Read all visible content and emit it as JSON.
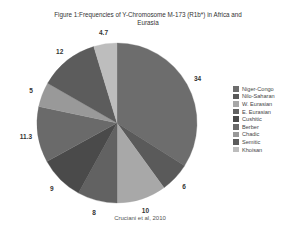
{
  "chart_data": {
    "type": "pie",
    "title": "Figure 1:Frequencies of Y-Chromosome M-173 (R1b*) in Africa and Eurasia",
    "title_lines": [
      "Figure 1:Frequencies of Y-Chromosome M-173 (R1b*) in Africa and",
      "Eurasia"
    ],
    "categories": [
      "Niger-Congo",
      "Nilo-Saharan",
      "W. Eurasian",
      "E. Eurasian",
      "Cushitic",
      "Berber",
      "Chadic",
      "Semitic",
      "Khoisan"
    ],
    "values": [
      34,
      6,
      10,
      8,
      9,
      11.3,
      5,
      12,
      4.7
    ],
    "data_labels": [
      "34",
      "6",
      "10",
      "8",
      "9",
      "11.3",
      "5",
      "12",
      "4.7"
    ],
    "colors": [
      "#6d6d6d",
      "#5a5a5a",
      "#a8a8a8",
      "#626262",
      "#4a4a4a",
      "#6a6a6a",
      "#999999",
      "#5c5c5c",
      "#bdbdbd"
    ],
    "legend_position": "right",
    "source_note": "Cruciani et al, 2010",
    "start_angle_deg": 0,
    "direction": "clockwise"
  }
}
